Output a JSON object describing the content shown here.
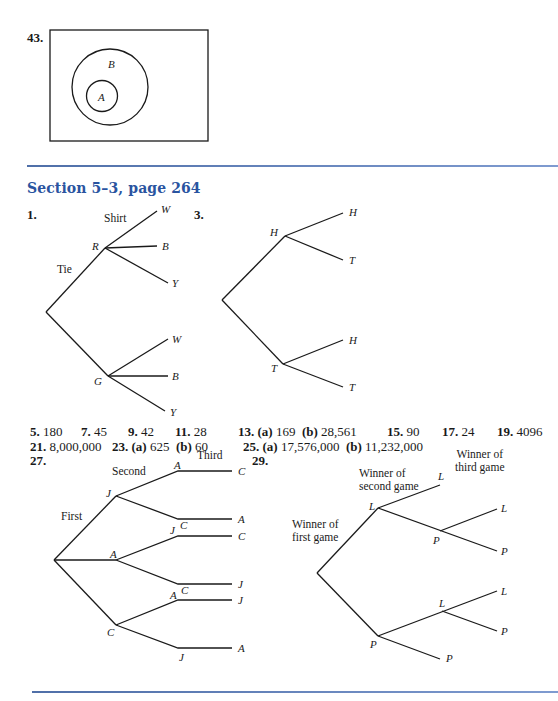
{
  "problem43": {
    "number": "43.",
    "outer_label": "B",
    "inner_label": "A"
  },
  "section": {
    "heading": "Section 5–3, page 264",
    "accent_color": "#2a54a0",
    "rule_color": "#6a86c0"
  },
  "problem1": {
    "number": "1.",
    "level1_label": "Tie",
    "level2_label": "Shirt",
    "nodes": {
      "tie_r": "R",
      "tie_g": "G"
    },
    "r_leaves": [
      "W",
      "B",
      "Y"
    ],
    "g_leaves": [
      "W",
      "B",
      "Y"
    ]
  },
  "problem3": {
    "number": "3.",
    "nodes": {
      "first_h": "H",
      "first_t": "T"
    },
    "h_leaves": [
      "H",
      "T"
    ],
    "t_leaves": [
      "H",
      "T"
    ]
  },
  "answers": {
    "row1": [
      {
        "num": "5.",
        "val": "180"
      },
      {
        "num": "7.",
        "val": "45"
      },
      {
        "num": "9.",
        "val": "42"
      },
      {
        "num": "11.",
        "val": "28"
      },
      {
        "num": "13.",
        "parts": [
          {
            "label": "(a)",
            "val": "169"
          },
          {
            "label": "(b)",
            "val": "28,561"
          }
        ]
      },
      {
        "num": "15.",
        "val": "90"
      },
      {
        "num": "17.",
        "val": "24"
      },
      {
        "num": "19.",
        "val": "4096"
      }
    ],
    "row2": [
      {
        "num": "21.",
        "val": "8,000,000"
      },
      {
        "num": "23.",
        "parts": [
          {
            "label": "(a)",
            "val": "625"
          },
          {
            "label": "(b)",
            "val": "60"
          }
        ]
      },
      {
        "num": "25.",
        "parts": [
          {
            "label": "(a)",
            "val": "17,576,000"
          },
          {
            "label": "(b)",
            "val": "11,232,000"
          }
        ]
      }
    ]
  },
  "problem27": {
    "number": "27.",
    "level_labels": {
      "first": "First",
      "second": "Second",
      "third": "Third"
    },
    "first_nodes": [
      "J",
      "A",
      "C"
    ],
    "second_nodes": {
      "J": [
        "A",
        "C"
      ],
      "A": [
        "J",
        "C"
      ],
      "C": [
        "A",
        "J"
      ]
    },
    "third_nodes": {
      "JA": "C",
      "JC": "A",
      "AJ": "C",
      "AC": "J",
      "CA": "J",
      "CJ": "A"
    }
  },
  "problem29": {
    "number": "29.",
    "level_labels": {
      "first": "Winner of first game",
      "first_l1": "Winner of",
      "first_l2": "first game",
      "second_l1": "Winner of",
      "second_l2": "second game",
      "third_l1": "Winner of",
      "third_l2": "third game"
    },
    "first_nodes": [
      "L",
      "P"
    ],
    "L_branch": {
      "second": [
        "L",
        "P"
      ],
      "P_third": [
        "L",
        "P"
      ]
    },
    "P_branch": {
      "second": [
        "L",
        "P"
      ],
      "L_third": [
        "L",
        "P"
      ]
    }
  }
}
